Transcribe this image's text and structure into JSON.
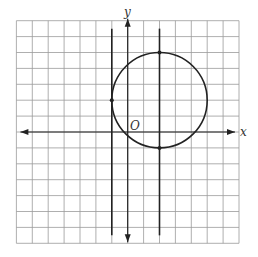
{
  "diagram": {
    "grid": {
      "xmin": -7,
      "xmax": 7,
      "ymin": -7,
      "ymax": 7,
      "step": 1
    },
    "axis_labels": {
      "x": "x",
      "y": "y",
      "origin": "O"
    },
    "circle": {
      "center": [
        2,
        2
      ],
      "radius": 3
    },
    "vertical_lines": [
      {
        "x": -1
      },
      {
        "x": 2
      }
    ],
    "points": [
      [
        -1,
        2
      ],
      [
        2,
        5
      ],
      [
        2,
        -1
      ]
    ],
    "colors": {
      "stroke": "#222222",
      "grid": "#9a9a9a",
      "background": "#ffffff"
    }
  },
  "chart_data": {
    "type": "scatter",
    "title": "",
    "xlabel": "x",
    "ylabel": "y",
    "xlim": [
      -7,
      7
    ],
    "ylim": [
      -7,
      7
    ],
    "grid": true,
    "shapes": [
      {
        "kind": "circle",
        "center": [
          2,
          2
        ],
        "radius": 3
      },
      {
        "kind": "vertical_line",
        "x": -1
      },
      {
        "kind": "vertical_line",
        "x": 2
      }
    ],
    "points": [
      [
        -1,
        2
      ],
      [
        2,
        5
      ],
      [
        2,
        -1
      ]
    ]
  }
}
